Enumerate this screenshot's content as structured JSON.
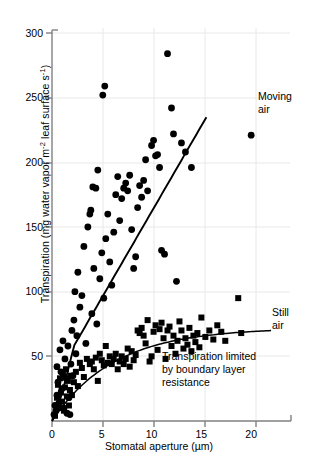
{
  "chart_data": {
    "type": "scatter",
    "title": "",
    "xlabel": "Stomatal aperture (µm)",
    "ylabel": "Transpiration (mg water vapor m⁻² leaf surface s⁻¹)",
    "ylabel_parts": {
      "pre": "Transpiration (mg water vapor m",
      "sup1": "-2",
      "mid": " leaf surface s",
      "sup2": "-1",
      "post": ")"
    },
    "xlim": [
      0,
      24
    ],
    "ylim": [
      0,
      300
    ],
    "xticks": [
      0,
      5,
      10,
      15,
      20
    ],
    "xtick_labels": [
      "0",
      "5",
      "10",
      "15",
      "20"
    ],
    "yticks": [
      50,
      100,
      150,
      200,
      250,
      300
    ],
    "ytick_labels": [
      "50",
      "100",
      "150",
      "200",
      "250",
      "300"
    ],
    "grid": "both-light",
    "legend_position": "inline-annotations",
    "annotations": [
      {
        "name": "moving-air-label",
        "text_lines": [
          "Moving",
          "air"
        ],
        "x_px": 258,
        "y_px": 100
      },
      {
        "name": "still-air-label",
        "text_lines": [
          "Still",
          "air"
        ],
        "x_px": 272,
        "y_px": 316
      },
      {
        "name": "boundary-layer-note",
        "text_lines": [
          "Transpiration limited",
          "by boundary layer",
          "resistance"
        ],
        "x_px": 162,
        "y_px": 360
      }
    ],
    "series": [
      {
        "name": "Moving air",
        "marker": "circle",
        "color": "#000000",
        "points": [
          [
            0.2,
            5
          ],
          [
            0.3,
            12
          ],
          [
            0.4,
            8
          ],
          [
            0.5,
            20
          ],
          [
            0.5,
            42
          ],
          [
            0.6,
            30
          ],
          [
            0.7,
            14
          ],
          [
            0.8,
            55
          ],
          [
            0.9,
            38
          ],
          [
            1.0,
            25
          ],
          [
            1.1,
            62
          ],
          [
            1.2,
            10
          ],
          [
            1.3,
            48
          ],
          [
            1.4,
            33
          ],
          [
            1.5,
            6
          ],
          [
            1.6,
            58
          ],
          [
            1.7,
            18
          ],
          [
            1.8,
            5
          ],
          [
            1.9,
            44
          ],
          [
            2.0,
            70
          ],
          [
            2.1,
            35
          ],
          [
            2.2,
            78
          ],
          [
            2.3,
            100
          ],
          [
            2.4,
            52
          ],
          [
            2.5,
            66
          ],
          [
            2.6,
            115
          ],
          [
            2.8,
            88
          ],
          [
            3.0,
            97
          ],
          [
            3.2,
            135
          ],
          [
            3.4,
            60
          ],
          [
            3.6,
            150
          ],
          [
            4.0,
            83
          ],
          [
            4.2,
            118
          ],
          [
            4.5,
            75
          ],
          [
            4.8,
            110
          ],
          [
            5.0,
            130
          ],
          [
            5.2,
            95
          ],
          [
            5.4,
            141
          ],
          [
            5.6,
            160
          ],
          [
            5.8,
            123
          ],
          [
            6.0,
            105
          ],
          [
            6.2,
            146
          ],
          [
            6.4,
            175
          ],
          [
            6.6,
            189
          ],
          [
            6.8,
            155
          ],
          [
            7.0,
            172
          ],
          [
            7.2,
            180
          ],
          [
            7.4,
            184
          ],
          [
            7.6,
            178
          ],
          [
            7.8,
            190
          ],
          [
            8.0,
            148
          ],
          [
            8.2,
            118
          ],
          [
            8.4,
            127
          ],
          [
            8.6,
            165
          ],
          [
            8.8,
            182
          ],
          [
            5.3,
            259
          ],
          [
            5.1,
            252
          ],
          [
            4.6,
            194
          ],
          [
            4.4,
            180
          ],
          [
            4.1,
            181
          ],
          [
            3.8,
            160
          ],
          [
            3.9,
            163
          ],
          [
            9.0,
            173
          ],
          [
            9.2,
            186
          ],
          [
            9.4,
            202
          ],
          [
            9.6,
            178
          ],
          [
            10.0,
            213
          ],
          [
            10.2,
            217
          ],
          [
            10.4,
            205
          ],
          [
            10.6,
            206
          ],
          [
            10.8,
            196
          ],
          [
            11.0,
            132
          ],
          [
            11.3,
            129
          ],
          [
            11.6,
            284
          ],
          [
            12.0,
            242
          ],
          [
            12.2,
            222
          ],
          [
            12.5,
            108
          ],
          [
            13.0,
            215
          ],
          [
            13.4,
            208
          ],
          [
            14.0,
            196
          ],
          [
            20.0,
            221
          ]
        ]
      },
      {
        "name": "Still air",
        "marker": "square",
        "color": "#000000",
        "points": [
          [
            0.3,
            4
          ],
          [
            0.5,
            18
          ],
          [
            0.6,
            28
          ],
          [
            0.7,
            10
          ],
          [
            0.8,
            33
          ],
          [
            0.9,
            22
          ],
          [
            1.0,
            15
          ],
          [
            1.1,
            36
          ],
          [
            1.2,
            8
          ],
          [
            1.3,
            26
          ],
          [
            1.4,
            40
          ],
          [
            1.5,
            19
          ],
          [
            1.6,
            31
          ],
          [
            1.7,
            12
          ],
          [
            1.8,
            24
          ],
          [
            1.9,
            35
          ],
          [
            2.0,
            20
          ],
          [
            2.2,
            30
          ],
          [
            2.4,
            38
          ],
          [
            2.6,
            27
          ],
          [
            2.8,
            45
          ],
          [
            3.0,
            41
          ],
          [
            3.2,
            34
          ],
          [
            3.5,
            48
          ],
          [
            3.8,
            44
          ],
          [
            4.0,
            46
          ],
          [
            4.2,
            40
          ],
          [
            4.4,
            49
          ],
          [
            4.6,
            31
          ],
          [
            4.8,
            52
          ],
          [
            5.0,
            47
          ],
          [
            5.2,
            43
          ],
          [
            5.4,
            58
          ],
          [
            5.6,
            45
          ],
          [
            5.8,
            50
          ],
          [
            6.0,
            44
          ],
          [
            6.2,
            48
          ],
          [
            6.4,
            52
          ],
          [
            6.6,
            40
          ],
          [
            6.8,
            46
          ],
          [
            7.0,
            50
          ],
          [
            7.2,
            44
          ],
          [
            7.4,
            48
          ],
          [
            7.6,
            56
          ],
          [
            7.8,
            42
          ],
          [
            8.0,
            54
          ],
          [
            8.2,
            47
          ],
          [
            8.4,
            51
          ],
          [
            8.6,
            70
          ],
          [
            8.8,
            68
          ],
          [
            9.0,
            72
          ],
          [
            9.2,
            66
          ],
          [
            9.4,
            60
          ],
          [
            9.6,
            78
          ],
          [
            9.8,
            46
          ],
          [
            10.0,
            50
          ],
          [
            10.2,
            69
          ],
          [
            10.4,
            74
          ],
          [
            10.6,
            55
          ],
          [
            10.8,
            71
          ],
          [
            11.0,
            76
          ],
          [
            11.2,
            64
          ],
          [
            11.4,
            48
          ],
          [
            11.6,
            70
          ],
          [
            11.8,
            73
          ],
          [
            12.0,
            58
          ],
          [
            12.2,
            66
          ],
          [
            12.4,
            52
          ],
          [
            12.6,
            62
          ],
          [
            12.8,
            77
          ],
          [
            13.0,
            70
          ],
          [
            13.2,
            56
          ],
          [
            13.4,
            64
          ],
          [
            13.6,
            59
          ],
          [
            13.8,
            72
          ],
          [
            14.0,
            54
          ],
          [
            14.2,
            66
          ],
          [
            14.4,
            61
          ],
          [
            14.6,
            68
          ],
          [
            14.8,
            57
          ],
          [
            15.0,
            80
          ],
          [
            15.4,
            65
          ],
          [
            15.8,
            70
          ],
          [
            16.2,
            63
          ],
          [
            16.6,
            74
          ],
          [
            17.0,
            69
          ],
          [
            17.4,
            62
          ],
          [
            18.7,
            95
          ],
          [
            19.0,
            68
          ]
        ]
      }
    ],
    "fit_curves": [
      {
        "name": "moving-air-fit",
        "label": "Moving air",
        "type": "rising-steep"
      },
      {
        "name": "still-air-fit",
        "label": "Still air",
        "type": "saturating"
      }
    ]
  }
}
